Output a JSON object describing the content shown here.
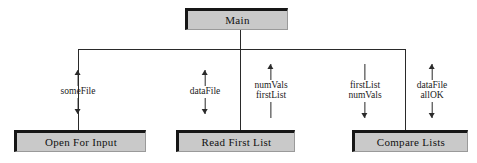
{
  "diagram": {
    "type": "structure-chart",
    "colors": {
      "box_fill": "#c9c9c9",
      "box_shadow": "#161616",
      "line": "#2a2a2a",
      "background": "#ffffff",
      "text": "#111111"
    }
  },
  "modules": [
    {
      "id": "main",
      "label": "Main",
      "x": 185,
      "y": 8,
      "w": 103,
      "h": 22,
      "font_size": 11
    },
    {
      "id": "open-for-input",
      "label": "Open For Input",
      "x": 14,
      "y": 130,
      "w": 132,
      "h": 22,
      "font_size": 11
    },
    {
      "id": "read-first-list",
      "label": "Read First List",
      "x": 176,
      "y": 130,
      "w": 119,
      "h": 22,
      "font_size": 11
    },
    {
      "id": "compare-lists",
      "label": "Compare Lists",
      "x": 352,
      "y": 130,
      "w": 116,
      "h": 22,
      "font_size": 11
    }
  ],
  "connectors": {
    "bus_y": 49,
    "bus_left_x": 78,
    "bus_right_x": 405,
    "main_stem_x": 240,
    "main_stem_top": 30,
    "drop_bottom_y": 130
  },
  "couples": [
    {
      "id": "some-file",
      "names": [
        "someFile"
      ],
      "top_arrow": "up",
      "bottom_arrow": "down",
      "x": 78,
      "y": 70,
      "font_size": 9.5
    },
    {
      "id": "data-file-read",
      "names": [
        "dataFile"
      ],
      "top_arrow": "up",
      "bottom_arrow": "down",
      "x": 205,
      "y": 70,
      "font_size": 9.5
    },
    {
      "id": "num-vals-first-list",
      "names": [
        "numVals",
        "firstList"
      ],
      "top_arrow": "up",
      "bottom_arrow": "plain",
      "x": 271,
      "y": 64,
      "font_size": 9.5
    },
    {
      "id": "first-list-num-vals",
      "names": [
        "firstList",
        "numVals"
      ],
      "top_arrow": "plain",
      "bottom_arrow": "down",
      "x": 365,
      "y": 64,
      "font_size": 9.5
    },
    {
      "id": "data-file-all-ok",
      "names": [
        "dataFile",
        "allOK"
      ],
      "top_arrow": "up",
      "bottom_arrow": "down",
      "x": 432,
      "y": 64,
      "font_size": 9.5
    }
  ]
}
